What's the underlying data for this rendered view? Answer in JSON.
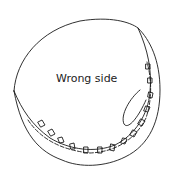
{
  "diagram": {
    "label": "Wrong side",
    "stroke_color": "#1a1a1a",
    "background": "#ffffff"
  }
}
